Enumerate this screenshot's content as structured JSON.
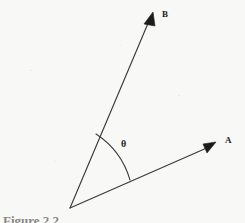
{
  "figure": {
    "background_color": "#f8f8f6",
    "stroke_color": "#333333",
    "canvas": {
      "width": 245,
      "height": 223
    },
    "vertex": {
      "x": 70,
      "y": 208
    },
    "vectors": [
      {
        "name": "A",
        "label": "A",
        "label_position": {
          "x": 225,
          "y": 136
        },
        "tip": {
          "x": 215,
          "y": 144
        },
        "arrowhead": "solid-triangle"
      },
      {
        "name": "B",
        "label": "B",
        "label_position": {
          "x": 162,
          "y": 10
        },
        "tip": {
          "x": 152,
          "y": 14
        },
        "arrowhead": "solid-triangle"
      }
    ],
    "angle": {
      "symbol": "θ",
      "label_position": {
        "x": 121,
        "y": 139
      },
      "arc_radius": 82,
      "arc_start": {
        "x": 96,
        "y": 134
      },
      "arc_end": {
        "x": 130,
        "y": 180
      }
    },
    "caption": "Figure 2.2"
  }
}
